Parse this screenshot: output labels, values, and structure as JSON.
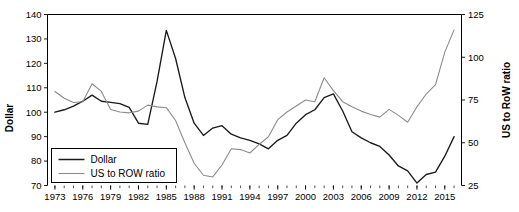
{
  "chart_data": {
    "type": "line",
    "title": "",
    "xlabel": "",
    "ylabel": "Dollar",
    "y2label": "US to RoW ratio",
    "grid": false,
    "legend_position": "lower-left",
    "xlim": [
      1972.2,
      2016.8
    ],
    "ylim": [
      70,
      140
    ],
    "y2lim": [
      25,
      125
    ],
    "x_tick_step": 3,
    "x_minor_tick_step": 1,
    "y_ticks": [
      70,
      80,
      90,
      100,
      110,
      120,
      130,
      140
    ],
    "y2_ticks": [
      25,
      50,
      75,
      100,
      125
    ],
    "x_tick_labels": [
      "1973",
      "1976",
      "1979",
      "1982",
      "1985",
      "1988",
      "1991",
      "1994",
      "1997",
      "2000",
      "2003",
      "2006",
      "2009",
      "2012",
      "2015"
    ],
    "x": [
      1973,
      1974,
      1975,
      1976,
      1977,
      1978,
      1979,
      1980,
      1981,
      1982,
      1983,
      1984,
      1985,
      1986,
      1987,
      1988,
      1989,
      1990,
      1991,
      1992,
      1993,
      1994,
      1995,
      1996,
      1997,
      1998,
      1999,
      2000,
      2001,
      2002,
      2003,
      2004,
      2005,
      2006,
      2007,
      2008,
      2009,
      2010,
      2011,
      2012,
      2013,
      2014,
      2015,
      2016
    ],
    "series": [
      {
        "name": "Dollar",
        "axis": "left",
        "color": "#1a1a1a",
        "values": [
          100.0,
          101.0,
          102.5,
          104.5,
          107.0,
          104.5,
          104.0,
          103.5,
          102.0,
          95.5,
          95.0,
          112.5,
          133.5,
          122.0,
          106.0,
          95.5,
          90.5,
          93.5,
          94.5,
          91.0,
          89.5,
          88.5,
          87.0,
          85.0,
          88.5,
          90.5,
          95.5,
          99.0,
          101.0,
          106.0,
          107.5,
          100.5,
          92.0,
          89.5,
          87.5,
          86.0,
          82.5,
          78.0,
          76.0,
          71.0,
          74.5,
          75.5,
          82.0,
          90.0
        ]
      },
      {
        "name": "US to ROW ratio",
        "axis": "right",
        "color": "#8c8c8c",
        "values": [
          80.0,
          76.0,
          73.5,
          74.0,
          84.5,
          80.0,
          69.5,
          68.0,
          67.5,
          68.5,
          72.0,
          71.0,
          70.5,
          63.0,
          50.0,
          38.0,
          31.0,
          30.0,
          37.0,
          46.5,
          46.0,
          44.0,
          49.0,
          53.5,
          63.5,
          68.0,
          71.5,
          75.0,
          74.0,
          88.0,
          80.5,
          74.0,
          71.0,
          68.5,
          66.5,
          65.0,
          69.5,
          66.0,
          62.0,
          71.0,
          78.5,
          84.0,
          103.0,
          116.0
        ]
      }
    ]
  },
  "legend": {
    "entries": [
      {
        "label": "Dollar",
        "color": "#1a1a1a"
      },
      {
        "label": "US to ROW ratio",
        "color": "#8c8c8c"
      }
    ]
  },
  "axes": {
    "left_title": "Dollar",
    "right_title": "US to RoW ratio"
  }
}
